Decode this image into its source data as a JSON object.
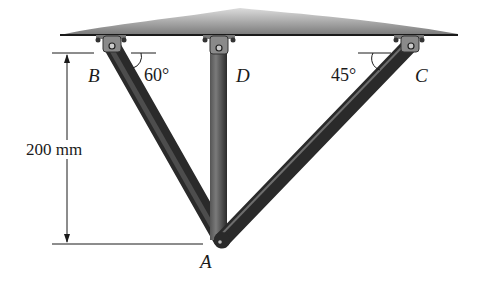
{
  "figure": {
    "points": {
      "B": {
        "label": "B"
      },
      "D": {
        "label": "D"
      },
      "C": {
        "label": "C"
      },
      "A": {
        "label": "A"
      }
    },
    "angles": {
      "at_B": "60°",
      "at_C": "45°"
    },
    "dimension": {
      "height": "200 mm"
    },
    "colors": {
      "member": "#3a3a3a",
      "member_highlight": "#6e6e6e",
      "ceiling": "#8a8a8a",
      "line": "#1a1a1a"
    }
  }
}
